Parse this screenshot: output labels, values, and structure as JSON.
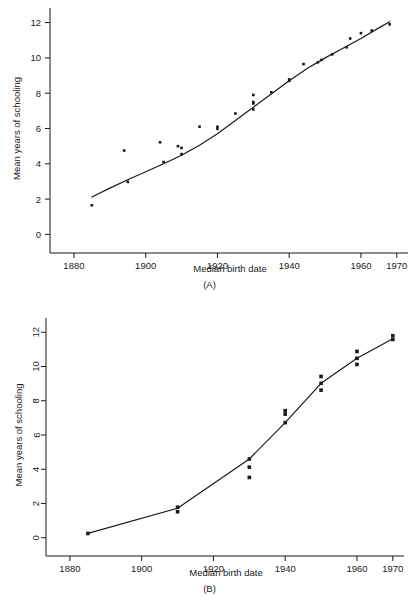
{
  "figure": {
    "panel_a_caption": "(A)",
    "panel_b_caption": "(B)"
  },
  "chart_data": [
    {
      "type": "scatter",
      "id": "panel-a",
      "title": "",
      "caption": "(A)",
      "xlabel": "Median birth date",
      "ylabel": "Mean years of schooling",
      "xlim": [
        1875,
        1972
      ],
      "ylim": [
        -0.6,
        12.6
      ],
      "xticks": [
        1880,
        1900,
        1920,
        1940,
        1960,
        1970
      ],
      "xticklabels": [
        "1880",
        "1900",
        "1920",
        "1940",
        "1960",
        "1970"
      ],
      "yticks": [
        0,
        2,
        4,
        6,
        8,
        10,
        12
      ],
      "yticklabels": [
        "0",
        "2",
        "4",
        "6",
        "8",
        "10",
        "12"
      ],
      "ytick_label_rotation": 0,
      "grid": false,
      "legend": false,
      "marker": "square",
      "marker_color": "#1a1a1a",
      "points": [
        {
          "x": 1885,
          "y": 1.65
        },
        {
          "x": 1894,
          "y": 4.75
        },
        {
          "x": 1895,
          "y": 2.98
        },
        {
          "x": 1904,
          "y": 5.22
        },
        {
          "x": 1905,
          "y": 4.1
        },
        {
          "x": 1909,
          "y": 5.0
        },
        {
          "x": 1910,
          "y": 4.9
        },
        {
          "x": 1910,
          "y": 4.55
        },
        {
          "x": 1915,
          "y": 6.1
        },
        {
          "x": 1920,
          "y": 6.1
        },
        {
          "x": 1920,
          "y": 5.98
        },
        {
          "x": 1925,
          "y": 6.85
        },
        {
          "x": 1930,
          "y": 7.9
        },
        {
          "x": 1930,
          "y": 7.5
        },
        {
          "x": 1930,
          "y": 7.42
        },
        {
          "x": 1930,
          "y": 7.08
        },
        {
          "x": 1935,
          "y": 8.05
        },
        {
          "x": 1940,
          "y": 8.78
        },
        {
          "x": 1940,
          "y": 8.7
        },
        {
          "x": 1944,
          "y": 9.65
        },
        {
          "x": 1948,
          "y": 9.75
        },
        {
          "x": 1949,
          "y": 9.88
        },
        {
          "x": 1952,
          "y": 10.2
        },
        {
          "x": 1956,
          "y": 10.6
        },
        {
          "x": 1957,
          "y": 11.1
        },
        {
          "x": 1960,
          "y": 11.4
        },
        {
          "x": 1963,
          "y": 11.55
        },
        {
          "x": 1968,
          "y": 11.9
        }
      ],
      "fit_line": [
        {
          "x": 1885,
          "y": 2.12
        },
        {
          "x": 1890,
          "y": 2.62
        },
        {
          "x": 1895,
          "y": 3.1
        },
        {
          "x": 1900,
          "y": 3.55
        },
        {
          "x": 1905,
          "y": 4.0
        },
        {
          "x": 1910,
          "y": 4.48
        },
        {
          "x": 1915,
          "y": 5.05
        },
        {
          "x": 1920,
          "y": 5.7
        },
        {
          "x": 1925,
          "y": 6.45
        },
        {
          "x": 1930,
          "y": 7.2
        },
        {
          "x": 1935,
          "y": 7.95
        },
        {
          "x": 1940,
          "y": 8.7
        },
        {
          "x": 1945,
          "y": 9.4
        },
        {
          "x": 1950,
          "y": 10.0
        },
        {
          "x": 1955,
          "y": 10.55
        },
        {
          "x": 1960,
          "y": 11.1
        },
        {
          "x": 1965,
          "y": 11.7
        },
        {
          "x": 1968,
          "y": 12.05
        }
      ]
    },
    {
      "type": "scatter",
      "id": "panel-b",
      "title": "",
      "caption": "(B)",
      "xlabel": "Median birth date",
      "ylabel": "Mean years of schooling",
      "xlim": [
        1875,
        1972
      ],
      "ylim": [
        -0.6,
        12.6
      ],
      "xticks": [
        1880,
        1900,
        1920,
        1940,
        1960,
        1970
      ],
      "xticklabels": [
        "1880",
        "1900",
        "1920",
        "1940",
        "1960",
        "1970"
      ],
      "yticks": [
        0,
        2,
        4,
        6,
        8,
        10,
        12
      ],
      "yticklabels": [
        "0",
        "2",
        "4",
        "6",
        "8",
        "10",
        "12"
      ],
      "ytick_label_rotation": 90,
      "grid": false,
      "legend": false,
      "marker": "square",
      "marker_color": "#1a1a1a",
      "points": [
        {
          "x": 1885,
          "y": 0.25
        },
        {
          "x": 1910,
          "y": 1.78
        },
        {
          "x": 1910,
          "y": 1.52
        },
        {
          "x": 1930,
          "y": 4.6
        },
        {
          "x": 1930,
          "y": 4.12
        },
        {
          "x": 1930,
          "y": 3.52
        },
        {
          "x": 1940,
          "y": 7.42
        },
        {
          "x": 1940,
          "y": 7.22
        },
        {
          "x": 1940,
          "y": 6.72
        },
        {
          "x": 1950,
          "y": 9.42
        },
        {
          "x": 1950,
          "y": 9.02
        },
        {
          "x": 1950,
          "y": 8.62
        },
        {
          "x": 1960,
          "y": 10.88
        },
        {
          "x": 1960,
          "y": 10.48
        },
        {
          "x": 1960,
          "y": 10.12
        },
        {
          "x": 1970,
          "y": 11.8
        },
        {
          "x": 1970,
          "y": 11.58
        }
      ],
      "fit_line": [
        {
          "x": 1885,
          "y": 0.25
        },
        {
          "x": 1910,
          "y": 1.72
        },
        {
          "x": 1930,
          "y": 4.6
        },
        {
          "x": 1940,
          "y": 6.72
        },
        {
          "x": 1950,
          "y": 9.02
        },
        {
          "x": 1960,
          "y": 10.48
        },
        {
          "x": 1970,
          "y": 11.62
        }
      ]
    }
  ]
}
